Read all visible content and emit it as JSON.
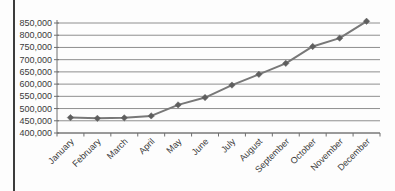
{
  "page": {
    "background": "#fdfdfd",
    "left_border_color": "#3c3c3c"
  },
  "chart_data": {
    "type": "line",
    "title": "",
    "xlabel": "",
    "ylabel": "",
    "categories": [
      "January",
      "February",
      "March",
      "April",
      "May",
      "June",
      "July",
      "August",
      "September",
      "October",
      "November",
      "December"
    ],
    "series": [
      {
        "name": "monthly-values",
        "values": [
          463000,
          460000,
          462000,
          470000,
          515000,
          545000,
          596000,
          640000,
          685000,
          754000,
          788000,
          857000
        ]
      }
    ],
    "ylim": [
      400000,
      850000
    ],
    "ytick_values": [
      400000,
      450000,
      500000,
      550000,
      600000,
      650000,
      700000,
      750000,
      800000,
      850000
    ],
    "ytick_labels": [
      "400,000",
      "450,000",
      "500,000",
      "550,000",
      "600,000",
      "650,000",
      "700,000",
      "750,000",
      "800,000",
      "850,000"
    ],
    "grid": true,
    "legend": "none",
    "marker": "diamond",
    "line_color": "#787878",
    "marker_color": "#5e5e5e",
    "gridline_color": "#8e8e8e",
    "axis_color": "#6f6f6f",
    "label_color": "#3a3a3a",
    "tick_font_size": 9
  }
}
